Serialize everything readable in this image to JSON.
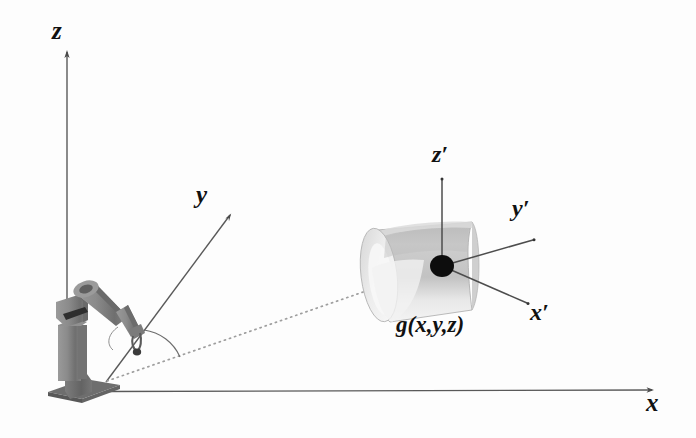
{
  "figure": {
    "background_color": "#fdfdfd",
    "line_color": "#555555",
    "label_color": "#111111",
    "object_color": "#c8c8c8",
    "robot_color": "#8a8a8a"
  },
  "world_frame": {
    "name": "world-coordinate-frame",
    "origin_label": "",
    "axes": [
      {
        "id": "z",
        "label": "z",
        "description": "vertical axis pointing up from robot base"
      },
      {
        "id": "y",
        "label": "y",
        "description": "axis pointing up-right through robot gripper"
      },
      {
        "id": "x",
        "label": "x",
        "description": "horizontal axis pointing right along ground"
      }
    ]
  },
  "object_frame": {
    "name": "object-coordinate-frame",
    "axes": [
      {
        "id": "z-prime",
        "label": "z′",
        "description": "vertical axis from object centroid"
      },
      {
        "id": "y-prime",
        "label": "y′",
        "description": "axis pointing up-right from object centroid"
      },
      {
        "id": "x-prime",
        "label": "x′",
        "description": "axis pointing down-right from object centroid"
      }
    ],
    "origin_label": "g(x,y,z)",
    "origin_marker": "filled-black-dot"
  },
  "annotations": {
    "angle_arc": "angle between y axis and line of sight to object",
    "sight_line": "dotted line from robot base to object centroid"
  },
  "objects": [
    {
      "name": "robot-manipulator",
      "type": "articulated arm with base, column, upper arm, forearm and gripper"
    },
    {
      "name": "target-object",
      "type": "cylinder",
      "label": "g(x,y,z)"
    }
  ]
}
